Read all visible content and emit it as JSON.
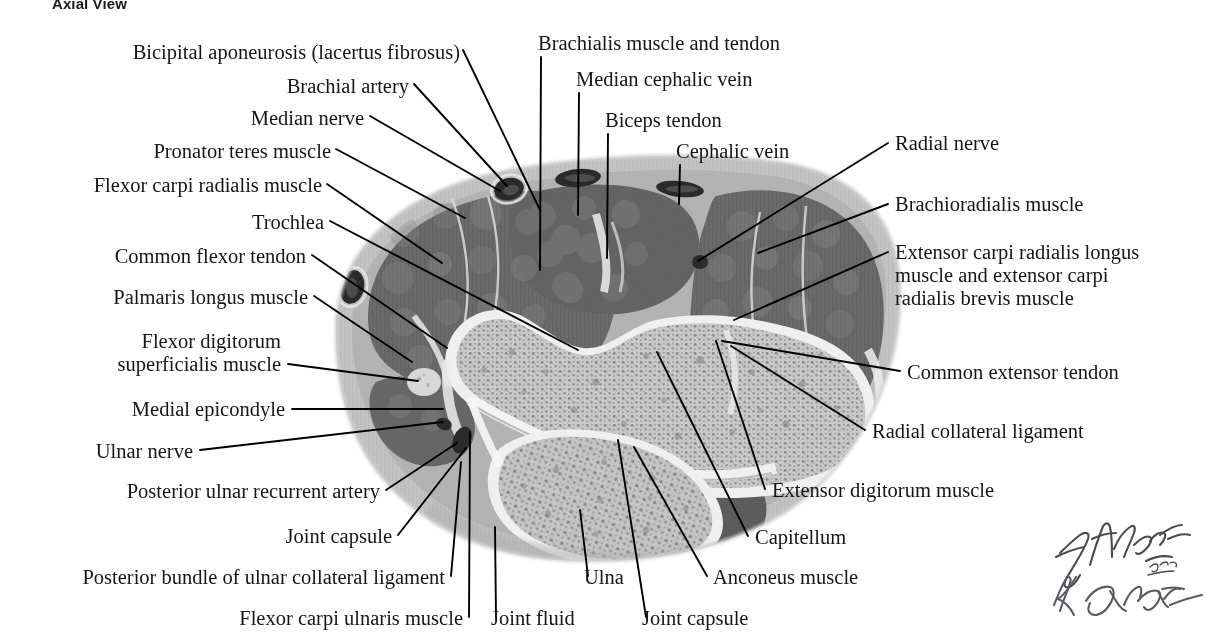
{
  "figure": {
    "title": "Axial View",
    "artist_signatures": [
      "F. Netter M.D.",
      "K. Carter"
    ]
  },
  "colors": {
    "background": "#ffffff",
    "text": "#151515",
    "leader_line": "#000000",
    "skin_fat": "#c3c3c3",
    "subcutaneous": "#b2b2b2",
    "muscle": "#6e6e6e",
    "muscle_dark": "#5d5d5d",
    "bone_marrow": "#cfcfcf",
    "cortical_bone": "#efefef",
    "vessel": "#2a2a2a",
    "cartilage": "#e6e6e6"
  },
  "labels": {
    "left": [
      {
        "id": "bicipital-aponeurosis",
        "text": "Bicipital aponeurosis (lacertus fibrosus)",
        "x": 460,
        "y": 58
      },
      {
        "id": "brachial-artery",
        "text": "Brachial artery",
        "x": 409,
        "y": 92
      },
      {
        "id": "median-nerve",
        "text": "Median nerve",
        "x": 364,
        "y": 124
      },
      {
        "id": "pronator-teres-muscle",
        "text": "Pronator teres muscle",
        "x": 331,
        "y": 157
      },
      {
        "id": "flexor-carpi-radialis-muscle",
        "text": "Flexor carpi radialis muscle",
        "x": 322,
        "y": 191
      },
      {
        "id": "trochlea",
        "text": "Trochlea",
        "x": 324,
        "y": 228
      },
      {
        "id": "common-flexor-tendon",
        "text": "Common flexor tendon",
        "x": 306,
        "y": 262
      },
      {
        "id": "palmaris-longus-muscle",
        "text": "Palmaris longus muscle",
        "x": 308,
        "y": 303
      },
      {
        "id": "flexor-digitorum-superficialis-muscle",
        "text": "Flexor digitorum\nsuperficialis muscle",
        "x": 281,
        "y": 347
      },
      {
        "id": "medial-epicondyle",
        "text": "Medial epicondyle",
        "x": 285,
        "y": 415
      },
      {
        "id": "ulnar-nerve",
        "text": "Ulnar nerve",
        "x": 193,
        "y": 457
      },
      {
        "id": "posterior-ulnar-recurrent-artery",
        "text": "Posterior ulnar recurrent artery",
        "x": 380,
        "y": 497
      },
      {
        "id": "joint-capsule-left",
        "text": "Joint capsule",
        "x": 392,
        "y": 542
      },
      {
        "id": "posterior-bundle-ulnar-collateral-ligament",
        "text": "Posterior bundle of ulnar collateral ligament",
        "x": 445,
        "y": 583
      },
      {
        "id": "flexor-carpi-ulnaris-muscle",
        "text": "Flexor carpi ulnaris muscle",
        "x": 463,
        "y": 624
      }
    ],
    "top": [
      {
        "id": "brachialis-muscle-and-tendon",
        "text": "Brachialis muscle and tendon",
        "x": 538,
        "y": 49
      },
      {
        "id": "median-cephalic-vein",
        "text": "Median cephalic vein",
        "x": 576,
        "y": 85
      },
      {
        "id": "biceps-tendon",
        "text": "Biceps tendon",
        "x": 605,
        "y": 126
      },
      {
        "id": "cephalic-vein",
        "text": "Cephalic vein",
        "x": 676,
        "y": 157
      }
    ],
    "right": [
      {
        "id": "radial-nerve",
        "text": "Radial nerve",
        "x": 895,
        "y": 149
      },
      {
        "id": "brachioradialis-muscle",
        "text": "Brachioradialis muscle",
        "x": 895,
        "y": 210
      },
      {
        "id": "extensor-carpi-radialis-longus-brevis",
        "text": "Extensor carpi radialis longus\nmuscle and extensor carpi\nradialis brevis muscle",
        "x": 895,
        "y": 258
      },
      {
        "id": "common-extensor-tendon",
        "text": "Common extensor tendon",
        "x": 907,
        "y": 378
      },
      {
        "id": "radial-collateral-ligament",
        "text": "Radial collateral ligament",
        "x": 872,
        "y": 437
      },
      {
        "id": "extensor-digitorum-muscle",
        "text": "Extensor digitorum muscle",
        "x": 772,
        "y": 496
      }
    ],
    "bottom": [
      {
        "id": "capitellum",
        "text": "Capitellum",
        "x": 755,
        "y": 543
      },
      {
        "id": "ulna",
        "text": "Ulna",
        "x": 584,
        "y": 583
      },
      {
        "id": "anconeus-muscle",
        "text": "Anconeus muscle",
        "x": 713,
        "y": 583
      },
      {
        "id": "joint-fluid",
        "text": "Joint fluid",
        "x": 491,
        "y": 624
      },
      {
        "id": "joint-capsule-bottom",
        "text": "Joint capsule",
        "x": 642,
        "y": 624
      }
    ]
  },
  "leader_lines": [
    {
      "id": "ld-bicipital-aponeurosis",
      "points": "463,50 540,210"
    },
    {
      "id": "ld-brachial-artery",
      "points": "414,84 507,186"
    },
    {
      "id": "ld-median-nerve",
      "points": "370,116 500,191"
    },
    {
      "id": "ld-pronator-teres",
      "points": "336,149 465,218"
    },
    {
      "id": "ld-flexor-carpi-radialis",
      "points": "327,184 442,263"
    },
    {
      "id": "ld-trochlea",
      "points": "330,221 578,350"
    },
    {
      "id": "ld-common-flexor-tendon",
      "points": "312,255 447,348"
    },
    {
      "id": "ld-palmaris-longus",
      "points": "314,296 412,362"
    },
    {
      "id": "ld-flexor-digitorum-sup",
      "points": "288,364 418,381"
    },
    {
      "id": "ld-medial-epicondyle",
      "points": "292,409 443,409"
    },
    {
      "id": "ld-ulnar-nerve",
      "points": "200,450 443,422"
    },
    {
      "id": "ld-post-ulnar-recurrent",
      "points": "386,490 457,443"
    },
    {
      "id": "ld-joint-capsule-left",
      "points": "398,535 466,448"
    },
    {
      "id": "ld-post-bundle-ucl",
      "points": "451,576 461,462"
    },
    {
      "id": "ld-flexor-carpi-ulnaris",
      "points": "469,617 470,432"
    },
    {
      "id": "ld-brachialis",
      "points": "541,57 540,270"
    },
    {
      "id": "ld-median-cephalic-vein",
      "points": "579,93 578,215"
    },
    {
      "id": "ld-biceps-tendon",
      "points": "608,134 607,258"
    },
    {
      "id": "ld-cephalic-vein",
      "points": "680,165 679,204"
    },
    {
      "id": "ld-radial-nerve",
      "points": "888,143 698,261"
    },
    {
      "id": "ld-brachioradialis",
      "points": "888,204 758,253"
    },
    {
      "id": "ld-ecrl-ecrb",
      "points": "888,252 734,320"
    },
    {
      "id": "ld-common-extensor-tendon",
      "points": "900,371 722,341"
    },
    {
      "id": "ld-radial-collateral-ligament",
      "points": "865,430 731,346"
    },
    {
      "id": "ld-extensor-digitorum",
      "points": "765,489 716,341"
    },
    {
      "id": "ld-capitellum",
      "points": "748,536 657,352"
    },
    {
      "id": "ld-ulna",
      "points": "588,576 580,510"
    },
    {
      "id": "ld-anconeus-muscle",
      "points": "707,576 634,447"
    },
    {
      "id": "ld-joint-fluid",
      "points": "496,617 495,527"
    },
    {
      "id": "ld-joint-capsule-bottom",
      "points": "646,617 618,440"
    }
  ]
}
